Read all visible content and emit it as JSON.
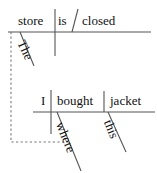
{
  "diagram": {
    "type": "reed-kellogg-sentence-diagram",
    "sentence": "The store is closed where I bought this jacket",
    "ink_color": "#111111",
    "rule_color": "#555555",
    "background": "#ffffff",
    "clauses": [
      {
        "name": "main-clause",
        "baseline_y": 32,
        "words": [
          {
            "id": "store",
            "label": "store",
            "role": "subject",
            "x": 18,
            "y": 14,
            "rotation": 0
          },
          {
            "id": "is",
            "label": "is",
            "role": "linking-verb",
            "x": 58,
            "y": 14,
            "rotation": 0
          },
          {
            "id": "closed",
            "label": "closed",
            "role": "predicate-adjective",
            "x": 82,
            "y": 14,
            "rotation": 0
          },
          {
            "id": "the",
            "label": "The",
            "role": "article-modifier",
            "x": 27,
            "y": 38,
            "rotation": 65
          }
        ]
      },
      {
        "name": "subordinate-clause",
        "baseline_y": 112,
        "words": [
          {
            "id": "i",
            "label": "I",
            "role": "subject",
            "x": 40,
            "y": 94,
            "rotation": 0
          },
          {
            "id": "bought",
            "label": "bought",
            "role": "transitive-verb",
            "x": 57,
            "y": 94,
            "rotation": 0
          },
          {
            "id": "jacket",
            "label": "jacket",
            "role": "direct-object",
            "x": 109,
            "y": 94,
            "rotation": 0
          },
          {
            "id": "where",
            "label": "where",
            "role": "relative-adverb",
            "x": 66,
            "y": 120,
            "rotation": 68
          },
          {
            "id": "this",
            "label": "this",
            "role": "demonstrative-modifier",
            "x": 114,
            "y": 118,
            "rotation": 68
          }
        ]
      }
    ],
    "connector": {
      "name": "dashed-clause-connector",
      "style": "dashed",
      "from": "main-clause-baseline",
      "to": "where-modifier"
    }
  }
}
